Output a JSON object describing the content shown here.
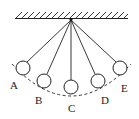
{
  "diagram": {
    "colors": {
      "stroke": "#222222",
      "background": "#ffffff"
    },
    "pivot": {
      "x": 71,
      "y": 19
    },
    "ceiling": {
      "x1": 15,
      "x2": 128,
      "y": 18
    },
    "bobs": [
      {
        "label": "A",
        "cx": 23,
        "cy": 68,
        "r": 7
      },
      {
        "label": "B",
        "cx": 44,
        "cy": 81,
        "r": 7
      },
      {
        "label": "C",
        "cx": 71,
        "cy": 87,
        "r": 7
      },
      {
        "label": "D",
        "cx": 98,
        "cy": 81,
        "r": 7
      },
      {
        "label": "E",
        "cx": 120,
        "cy": 68,
        "r": 7
      }
    ],
    "labels": {
      "a": "A",
      "b": "B",
      "c": "C",
      "d": "D",
      "e": "E"
    },
    "path": {
      "style": "dashed-arc"
    }
  }
}
